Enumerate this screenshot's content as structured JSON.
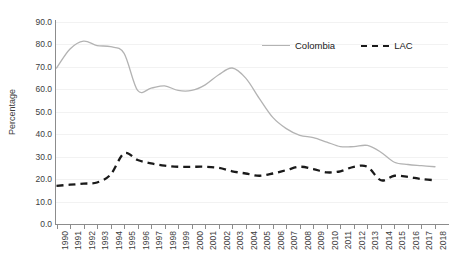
{
  "chart_data": {
    "type": "line",
    "title": "",
    "xlabel": "",
    "ylabel": "Percentage",
    "ylim": [
      0,
      90
    ],
    "ytick_step": 10,
    "grid": true,
    "legend_position": "top-right",
    "x": [
      1990,
      1991,
      1992,
      1993,
      1994,
      1995,
      1996,
      1997,
      1998,
      1999,
      2000,
      2001,
      2002,
      2003,
      2004,
      2005,
      2006,
      2007,
      2008,
      2009,
      2010,
      2011,
      2012,
      2013,
      2014,
      2015,
      2016,
      2017,
      2018
    ],
    "ytick_labels": [
      "90.0",
      "80.0",
      "70.0",
      "60.0",
      "50.0",
      "40.0",
      "30.0",
      "20.0",
      "10.0",
      "0.0"
    ],
    "ytick_values": [
      90,
      80,
      70,
      60,
      50,
      40,
      30,
      20,
      10,
      0
    ],
    "xtick_labels": [
      "1990",
      "1991",
      "1992",
      "1993",
      "1994",
      "1995",
      "1996",
      "1997",
      "1998",
      "1999",
      "2000",
      "2001",
      "2002",
      "2003",
      "2004",
      "2005",
      "2006",
      "2007",
      "2008",
      "2009",
      "2010",
      "2011",
      "2012",
      "2013",
      "2014",
      "2015",
      "2016",
      "2017",
      "2018"
    ],
    "series": [
      {
        "name": "Colombia",
        "color": "#b3b3b3",
        "style": "solid",
        "values": [
          69.5,
          78.0,
          81.5,
          79.5,
          79.0,
          76.0,
          59.5,
          60.5,
          61.5,
          59.5,
          59.5,
          62.0,
          66.5,
          69.5,
          65.0,
          56.0,
          47.5,
          42.5,
          39.5,
          38.5,
          36.5,
          34.5,
          34.5,
          35.0,
          32.0,
          27.5,
          26.5,
          26.0,
          25.5
        ]
      },
      {
        "name": "LAC",
        "color": "#1a1a1a",
        "style": "dashed",
        "values": [
          17.0,
          17.5,
          18.0,
          18.5,
          22.0,
          31.5,
          28.5,
          27.0,
          26.0,
          25.5,
          25.5,
          25.5,
          25.0,
          23.5,
          22.5,
          21.5,
          22.5,
          24.0,
          25.5,
          24.5,
          23.0,
          23.5,
          25.5,
          25.5,
          19.5,
          21.5,
          21.0,
          20.0,
          19.5
        ]
      }
    ]
  },
  "legend": {
    "items": [
      {
        "label": "Colombia",
        "swatch": "solid-line-swatch"
      },
      {
        "label": "LAC",
        "swatch": "dashed-line-swatch"
      }
    ]
  },
  "axes": {
    "y_title": "Percentage"
  }
}
